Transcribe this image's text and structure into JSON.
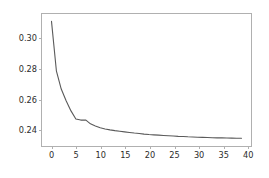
{
  "chart_data": {
    "type": "line",
    "title": "",
    "xlabel": "",
    "ylabel": "",
    "xlim": [
      -1.95,
      40.95
    ],
    "ylim": [
      0.2283,
      0.3159
    ],
    "grid": false,
    "legend": null,
    "line_color": "#5a5a5a",
    "line_width": 1.1,
    "background": "#ffffff",
    "frame_color": "#b0b0b0",
    "tick_label_color": "#2b2b2b",
    "xticks": [
      0,
      5,
      10,
      15,
      20,
      25,
      30,
      35,
      40
    ],
    "xtick_labels": [
      "0",
      "5",
      "10",
      "15",
      "20",
      "25",
      "30",
      "35",
      "40"
    ],
    "yticks": [
      0.24,
      0.26,
      0.28,
      0.3
    ],
    "ytick_labels": [
      "0.24",
      "0.26",
      "0.28",
      "0.30"
    ],
    "series": [
      {
        "name": "curve",
        "x": [
          0,
          1,
          2,
          3,
          4,
          5,
          6,
          7,
          8,
          9,
          10,
          11,
          12,
          13,
          14,
          15,
          16,
          17,
          18,
          19,
          20,
          21,
          22,
          23,
          24,
          25,
          26,
          27,
          28,
          29,
          30,
          31,
          32,
          33,
          34,
          35,
          36,
          37,
          38,
          39
        ],
        "y": [
          0.311,
          0.2782,
          0.2661,
          0.2583,
          0.2516,
          0.2462,
          0.2455,
          0.2456,
          0.243,
          0.2416,
          0.2404,
          0.2396,
          0.239,
          0.2385,
          0.2381,
          0.2377,
          0.2373,
          0.2369,
          0.2366,
          0.2362,
          0.2359,
          0.2357,
          0.2355,
          0.2353,
          0.2351,
          0.2349,
          0.2347,
          0.2346,
          0.2344,
          0.2343,
          0.2341,
          0.234,
          0.2339,
          0.2338,
          0.2337,
          0.2337,
          0.2336,
          0.2335,
          0.2334,
          0.2334
        ]
      }
    ]
  }
}
